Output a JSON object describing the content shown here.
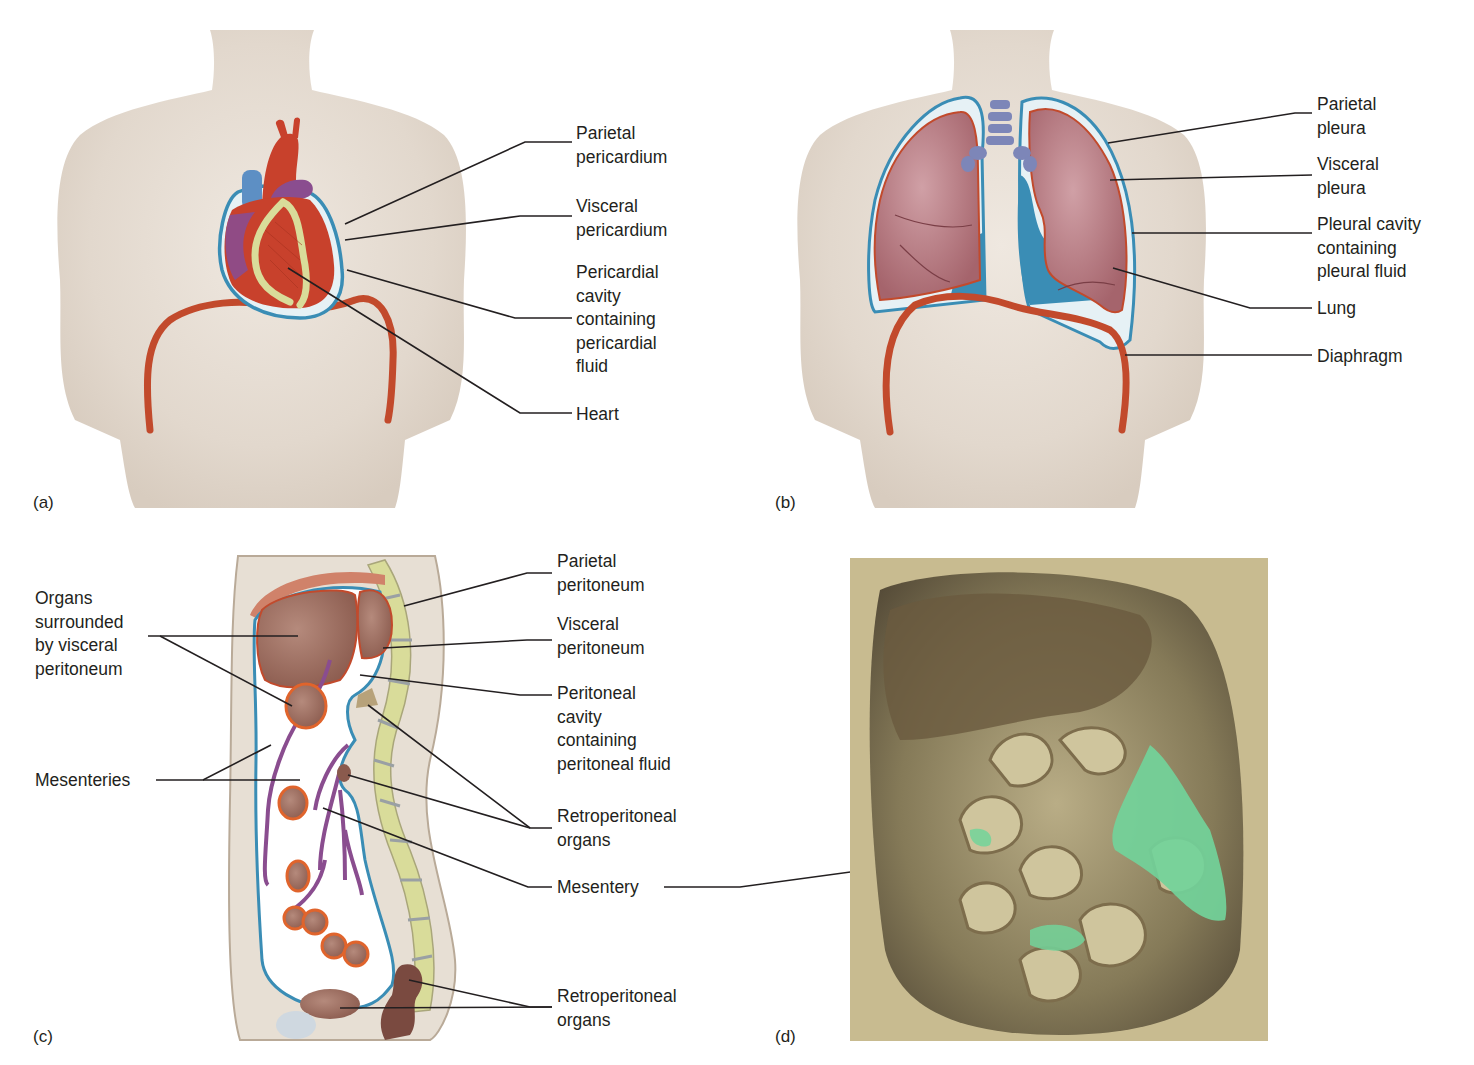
{
  "figure": {
    "panels": [
      {
        "letter": "(a)",
        "subject": "heart-pericardium",
        "labels": [
          {
            "lines": [
              "Parietal",
              "pericardium"
            ]
          },
          {
            "lines": [
              "Visceral",
              "pericardium"
            ]
          },
          {
            "lines": [
              "Pericardial",
              "cavity",
              "containing",
              "pericardial",
              "fluid"
            ]
          },
          {
            "lines": [
              "Heart"
            ]
          }
        ]
      },
      {
        "letter": "(b)",
        "subject": "lungs-pleura",
        "labels": [
          {
            "lines": [
              "Parietal",
              "pleura"
            ]
          },
          {
            "lines": [
              "Visceral",
              "pleura"
            ]
          },
          {
            "lines": [
              "Pleural cavity",
              "containing",
              "pleural fluid"
            ]
          },
          {
            "lines": [
              "Lung"
            ]
          },
          {
            "lines": [
              "Diaphragm"
            ]
          }
        ]
      },
      {
        "letter": "(c)",
        "subject": "abdomen-peritoneum-sagittal",
        "labels": [
          {
            "lines": [
              "Organs",
              "surrounded",
              "by visceral",
              "peritoneum"
            ]
          },
          {
            "lines": [
              "Mesenteries"
            ]
          },
          {
            "lines": [
              "Parietal",
              "peritoneum"
            ]
          },
          {
            "lines": [
              "Visceral",
              "peritoneum"
            ]
          },
          {
            "lines": [
              "Peritoneal",
              "cavity",
              "containing",
              "peritoneal fluid"
            ]
          },
          {
            "lines": [
              "Retroperitoneal",
              "organs"
            ]
          },
          {
            "lines": [
              "Mesentery"
            ]
          },
          {
            "lines": [
              "Retroperitoneal",
              "organs"
            ]
          }
        ]
      },
      {
        "letter": "(d)",
        "subject": "cadaver-abdomen-photo",
        "labels": []
      }
    ],
    "colors": {
      "skin": "#e3d9cf",
      "membrane_blue": "#3a8db5",
      "fluid_pale": "#e6f1f5",
      "heart_red": "#c8412c",
      "vessel_purple": "#8a4d8f",
      "fat_yellow": "#d9dc9a",
      "lung_pink": "#b5737a",
      "diaphragm": "#c24a2c",
      "organ_brown": "#9a6a5c",
      "mesentery_green": "#72d39a",
      "leader": "#231f20"
    }
  }
}
